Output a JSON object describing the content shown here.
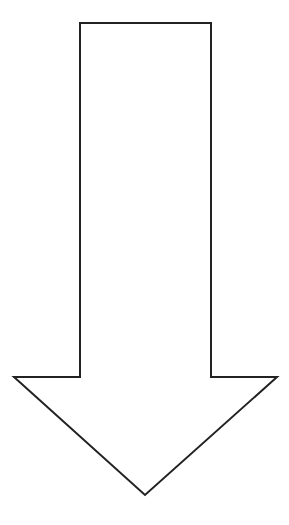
{
  "diagram": {
    "shape": "down-arrow",
    "colors": {
      "background": "#ffffff",
      "stroke": "#222222",
      "fill": "#ffffff"
    },
    "stroke_width": 2,
    "points": "80,23 211,23 211,377 277,377 145,495 14,377 80,377"
  }
}
